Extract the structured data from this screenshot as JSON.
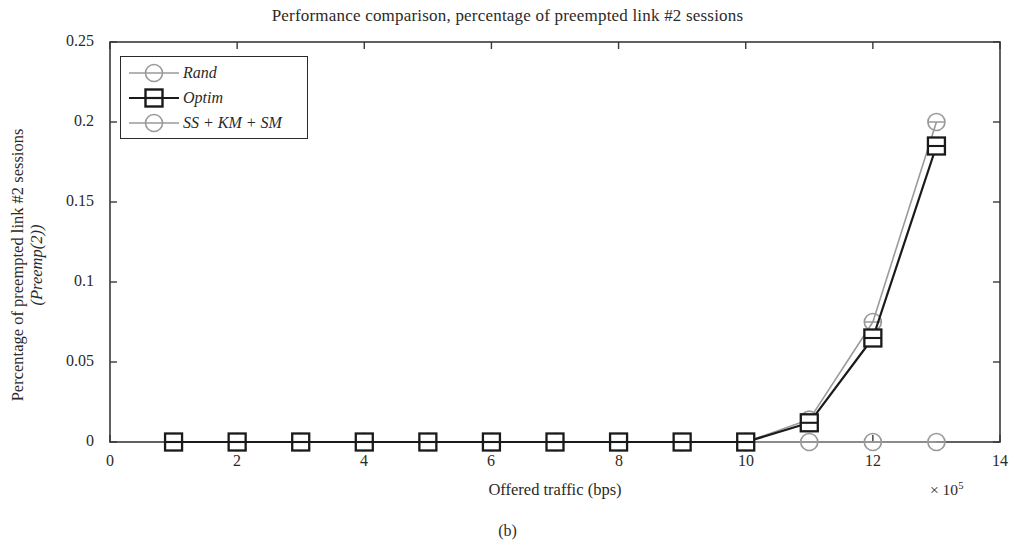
{
  "figure": {
    "title": "Performance comparison, percentage of preempted link #2 sessions",
    "subcaption": "(b)",
    "xlabel": "Offered traffic (bps)",
    "x_multiplier_prefix": "× 10",
    "x_multiplier_exponent": "5",
    "ylabel_line1": "Percentage of preempted link #2 sessions",
    "ylabel_line2": "(Preemp(2))"
  },
  "legend": {
    "position": "top-left-inside",
    "entries": [
      {
        "label": "Rand",
        "marker": "circle",
        "color": "#9a9a9a"
      },
      {
        "label": "Optim",
        "marker": "square",
        "color": "#1a1a1a"
      },
      {
        "label": "SS + KM + SM",
        "marker": "circle",
        "color": "#9a9a9a"
      }
    ]
  },
  "chart_data": {
    "type": "line",
    "title": "Performance comparison, percentage of preempted link #2 sessions",
    "xlabel": "Offered traffic (bps)",
    "ylabel": "Percentage of preempted link #2 sessions (Preemp(2))",
    "x_axis_multiplier": "x 10^5",
    "xlim": [
      0,
      14
    ],
    "ylim": [
      0,
      0.25
    ],
    "xticks": [
      0,
      2,
      4,
      6,
      8,
      10,
      12,
      14
    ],
    "xtick_labels": [
      "0",
      "2",
      "4",
      "6",
      "8",
      "10",
      "12",
      "14"
    ],
    "yticks": [
      0,
      0.05,
      0.1,
      0.15,
      0.2,
      0.25
    ],
    "ytick_labels": [
      "0",
      "0.05",
      "0.1",
      "0.15",
      "0.2",
      "0.25"
    ],
    "grid": false,
    "legend_position": "upper left",
    "x": [
      1,
      2,
      3,
      4,
      5,
      6,
      7,
      8,
      9,
      10,
      11,
      12,
      13
    ],
    "series": [
      {
        "name": "Rand",
        "marker": "circle",
        "color": "#9a9a9a",
        "values": [
          0,
          0,
          0,
          0,
          0,
          0,
          0,
          0,
          0,
          0,
          0,
          0,
          0
        ]
      },
      {
        "name": "Optim",
        "marker": "square",
        "color": "#1a1a1a",
        "values": [
          0,
          0,
          0,
          0,
          0,
          0,
          0,
          0,
          0,
          0,
          0.012,
          0.065,
          0.185
        ]
      },
      {
        "name": "SS + KM + SM",
        "marker": "circle",
        "color": "#9a9a9a",
        "values": [
          0,
          0,
          0,
          0,
          0,
          0,
          0,
          0,
          0,
          0,
          0.014,
          0.075,
          0.2
        ]
      }
    ]
  },
  "axis_tick_text": {
    "y": [
      "0.25",
      "0.2",
      "0.15",
      "0.1",
      "0.05",
      "0"
    ],
    "x": [
      "0",
      "2",
      "4",
      "6",
      "8",
      "10",
      "12",
      "14"
    ]
  }
}
